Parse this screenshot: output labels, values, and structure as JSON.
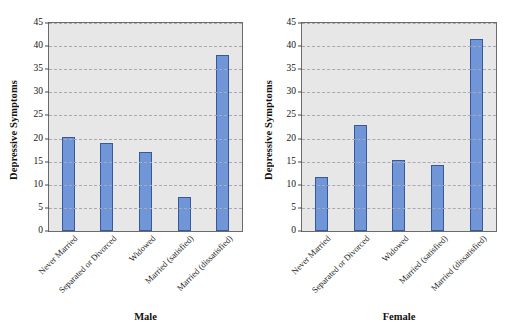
{
  "chart_data": [
    {
      "type": "bar",
      "title": "Male",
      "xlabel": "",
      "ylabel": "Depressive Symptoms",
      "ylim": [
        0,
        45
      ],
      "ytick_step": 5,
      "yticks": [
        0,
        5,
        10,
        15,
        20,
        25,
        30,
        35,
        40,
        45
      ],
      "grid": true,
      "legend": "none",
      "categories": [
        "Never Married",
        "Separated or Divorced",
        "Widowed",
        "Married (satisfied)",
        "Married (dissatisfied)"
      ],
      "values": [
        20.4,
        19.1,
        17.2,
        7.3,
        38.0
      ],
      "bar_color": "#7096d8",
      "bar_edge_color": "#38589e",
      "plot_background": "#e7e7e7"
    },
    {
      "type": "bar",
      "title": "Female",
      "xlabel": "",
      "ylabel": "Depressive Symptoms",
      "ylim": [
        0,
        45
      ],
      "ytick_step": 5,
      "yticks": [
        0,
        5,
        10,
        15,
        20,
        25,
        30,
        35,
        40,
        45
      ],
      "grid": true,
      "legend": "none",
      "categories": [
        "Never Married",
        "Separated or Divorced",
        "Widowed",
        "Married (satisfied)",
        "Married (dissatisfied)"
      ],
      "values": [
        11.7,
        22.9,
        15.3,
        14.2,
        41.6
      ],
      "bar_color": "#7096d8",
      "bar_edge_color": "#38589e",
      "plot_background": "#e7e7e7"
    }
  ],
  "figure": {
    "background": "#ffffff",
    "panels": [
      "Male",
      "Female"
    ]
  }
}
